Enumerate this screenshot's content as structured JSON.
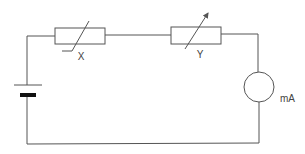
{
  "diagram": {
    "type": "circuit",
    "colors": {
      "line": "#555555",
      "battery_plate": "#111111",
      "background": "#ffffff"
    },
    "components": [
      {
        "id": "battery",
        "kind": "cell",
        "label": ""
      },
      {
        "id": "X",
        "kind": "thermistor",
        "label": "X"
      },
      {
        "id": "Y",
        "kind": "variable-resistor",
        "label": "Y"
      },
      {
        "id": "meter",
        "kind": "milliammeter",
        "label": "mA"
      }
    ],
    "labels": {
      "x": "X",
      "y": "Y",
      "meter": "mA"
    }
  }
}
